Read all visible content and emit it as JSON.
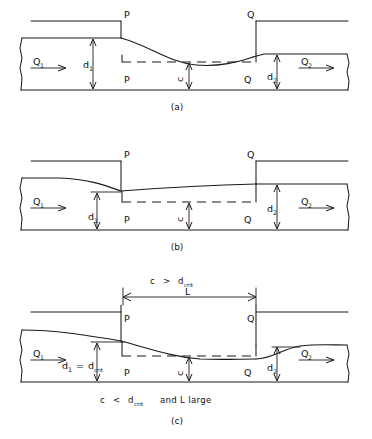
{
  "figure": {
    "title_text": "",
    "line_color": "#1a1a1a",
    "background": "#ffffff"
  },
  "panels": [
    {
      "id": "a",
      "caption": "(a)",
      "labels": {
        "q_in": "Q",
        "q_in_sub": "1",
        "q_out": "Q",
        "q_out_sub": "2",
        "depth_up": "d",
        "depth_up_sub": "1",
        "depth_down": "d",
        "depth_down_sub": "2",
        "hump_height": "c",
        "point_top_left": "P",
        "point_top_right": "Q",
        "point_bottom_left": "P",
        "point_bottom_right": "Q"
      }
    },
    {
      "id": "b",
      "caption": "(b)",
      "labels": {
        "q_in": "Q",
        "q_in_sub": "1",
        "q_out": "Q",
        "q_out_sub": "2",
        "depth_up": "d",
        "depth_up_sub": "1",
        "depth_down": "d",
        "depth_down_sub": "2",
        "hump_height": "c",
        "point_top_left": "P",
        "point_top_right": "Q",
        "point_bottom_left": "P",
        "point_bottom_right": "Q"
      }
    },
    {
      "id": "c",
      "caption": "(c)",
      "labels": {
        "q_in": "Q",
        "q_in_sub": "1",
        "q_out": "Q",
        "q_out_sub": "2",
        "depth_up": "d",
        "depth_up_sub": "1",
        "depth_eq": "=",
        "depth_crit": "d",
        "depth_crit_sub": "crit",
        "depth_down": "d",
        "depth_down_sub": "2",
        "hump_height": "c",
        "length_label": "L",
        "point_top_left": "P",
        "point_top_right": "Q",
        "point_bottom_left": "P",
        "point_bottom_right": "Q"
      },
      "conditions": {
        "above_symbol": "c",
        "above_operator": ">",
        "above_var": "d",
        "above_sub": "crit",
        "below_symbol": "c",
        "below_operator": "<",
        "below_var": "d",
        "below_sub": "crit",
        "below_extra": "and L large"
      }
    }
  ]
}
